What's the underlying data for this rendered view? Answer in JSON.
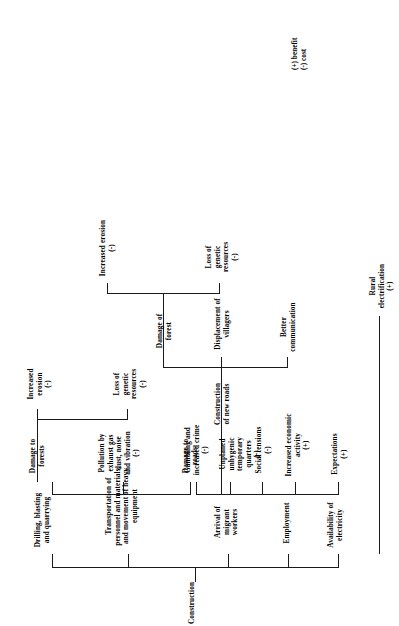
{
  "diagram": {
    "root": {
      "id": "construction",
      "label": "Construction"
    },
    "legend": {
      "benefit_symbol": "(+)",
      "benefit_label": "benefit",
      "cost_symbol": "(-)",
      "cost_label": "cost",
      "text": "(+) benefit\n(-) cost"
    },
    "nodes": [
      {
        "id": "construction",
        "label": "Construction"
      },
      {
        "id": "drilling",
        "label": "Drilling, blasting\nand quarrying"
      },
      {
        "id": "transportation",
        "label": "Transportation of\npersonnel and materials,\nand movement of heavy\nequipment"
      },
      {
        "id": "arrival-migrant-workers",
        "label": "Arrival of migrant\nworkers"
      },
      {
        "id": "employment",
        "label": "Employment"
      },
      {
        "id": "availability-electricity",
        "label": "Availability of\nelectricity"
      },
      {
        "id": "damage-to-forests",
        "label": "Damage to\nforests"
      },
      {
        "id": "pollution-exhaust",
        "label": "Pollution by\nexhaust gas\ndust, noise\nand vibration\n(-)"
      },
      {
        "id": "damage-to-roads",
        "label": "Damage to\nroads"
      },
      {
        "id": "gambling-crime",
        "label": "Gambling and\nincreased crime\n(-)"
      },
      {
        "id": "unplanned-quarters",
        "label": "Unplaned\nunhygenic\ntemporary\nquarters\n(-)"
      },
      {
        "id": "social-tensions",
        "label": "Social tensions\n(-)"
      },
      {
        "id": "expectations",
        "label": "Expectations\n(+)"
      },
      {
        "id": "increased-economic",
        "label": "Increased economic\nactivity\n(+)"
      },
      {
        "id": "rural-electrification",
        "label": "Rural\nelectrification\n(+)"
      },
      {
        "id": "construction-new-roads",
        "label": "Construction\nof new roads"
      },
      {
        "id": "increased-erosion-top",
        "label": "Increased\nerosion\n(-)"
      },
      {
        "id": "loss-genetic-top",
        "label": "Loss of\ngenetic\nresources\n(-)"
      },
      {
        "id": "damage-of-forest",
        "label": "Damage of\nforest"
      },
      {
        "id": "better-communication",
        "label": "Better\ncommunication"
      },
      {
        "id": "displacement-villagers",
        "label": "Displacement of\nvillagers"
      },
      {
        "id": "increased-erosion-bot",
        "label": "Increased erosion\n(-)"
      },
      {
        "id": "loss-genetic-bot",
        "label": "Loss of\ngenetic\nresources\n(-)"
      }
    ],
    "edges": [
      {
        "from": "construction",
        "to": "drilling"
      },
      {
        "from": "construction",
        "to": "transportation"
      },
      {
        "from": "construction",
        "to": "arrival-migrant-workers"
      },
      {
        "from": "construction",
        "to": "employment"
      },
      {
        "from": "construction",
        "to": "availability-electricity"
      },
      {
        "from": "transportation",
        "to": "damage-to-forests"
      },
      {
        "from": "transportation",
        "to": "pollution-exhaust"
      },
      {
        "from": "transportation",
        "to": "damage-to-roads"
      },
      {
        "from": "arrival-migrant-workers",
        "to": "gambling-crime"
      },
      {
        "from": "arrival-migrant-workers",
        "to": "unplanned-quarters"
      },
      {
        "from": "arrival-migrant-workers",
        "to": "social-tensions"
      },
      {
        "from": "employment",
        "to": "expectations"
      },
      {
        "from": "employment",
        "to": "increased-economic"
      },
      {
        "from": "availability-electricity",
        "to": "rural-electrification"
      },
      {
        "from": "damage-to-forests",
        "to": "increased-erosion-top"
      },
      {
        "from": "damage-to-forests",
        "to": "loss-genetic-top"
      },
      {
        "from": "construction-new-roads",
        "to": "damage-of-forest"
      },
      {
        "from": "construction-new-roads",
        "to": "better-communication"
      },
      {
        "from": "construction-new-roads",
        "to": "displacement-villagers"
      },
      {
        "from": "damage-of-forest",
        "to": "increased-erosion-bot"
      },
      {
        "from": "damage-of-forest",
        "to": "loss-genetic-bot"
      }
    ]
  }
}
